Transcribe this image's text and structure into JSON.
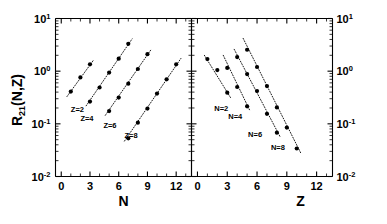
{
  "figure": {
    "background_color": "#ffffff",
    "marker_color": "#000000",
    "line_color": "#000000"
  },
  "chart_data": {
    "type": "scatter",
    "title": "",
    "scale": "semilog-y",
    "grid": false,
    "legend_position": "inline-annotations",
    "ylabel": "R21(N,Z)",
    "ylabel_base": "R",
    "ylabel_subscript": "21",
    "ylabel_tail": "(N,Z)",
    "ylim": [
      0.01,
      10
    ],
    "ytick_values": [
      0.01,
      0.1,
      1,
      10
    ],
    "ytick_labels": [
      "10-2",
      "10-1",
      "100",
      "101"
    ],
    "ytick_mantissa": "10",
    "ytick_exponents": [
      "-2",
      "-1",
      "0",
      "1"
    ],
    "panels": [
      {
        "name": "left-panel",
        "xlabel": "N",
        "xlim": [
          -0.6,
          13.6
        ],
        "xtick_values": [
          0,
          3,
          6,
          9,
          12
        ],
        "xtick_labels": [
          "0",
          "3",
          "6",
          "9",
          "12"
        ],
        "series": [
          {
            "name": "Z=2",
            "label": "Z=2",
            "label_x": 1.0,
            "label_y": 0.17,
            "x": [
              1,
              2,
              3
            ],
            "y": [
              0.41,
              0.76,
              1.35
            ],
            "fit": {
              "x0": 0.6,
              "y0": 0.33,
              "x1": 3.4,
              "y1": 1.65
            }
          },
          {
            "name": "Z=4",
            "label": "Z=4",
            "label_x": 2.0,
            "label_y": 0.115,
            "x": [
              3,
              4,
              5,
              6,
              7
            ],
            "y": [
              0.265,
              0.49,
              0.94,
              1.73,
              3.3
            ],
            "fit": {
              "x0": 2.6,
              "y0": 0.22,
              "x1": 7.4,
              "y1": 4.1
            }
          },
          {
            "name": "Z=6",
            "label": "Z=6",
            "label_x": 4.4,
            "label_y": 0.082,
            "x": [
              5,
              6,
              7,
              8,
              9
            ],
            "y": [
              0.175,
              0.315,
              0.58,
              1.1,
              2.1
            ],
            "fit": {
              "x0": 4.6,
              "y0": 0.145,
              "x1": 9.4,
              "y1": 2.6
            }
          },
          {
            "name": "Z=8",
            "label": "Z=8",
            "label_x": 6.6,
            "label_y": 0.055,
            "x": [
              8,
              9,
              10,
              11,
              12
            ],
            "y": [
              0.105,
              0.195,
              0.375,
              0.7,
              1.35
            ],
            "fit": {
              "x0": 6.6,
              "y0": 0.047,
              "x1": 12.5,
              "y1": 1.75
            }
          }
        ],
        "extra_points": [
          {
            "x": 7,
            "y": 0.053
          }
        ]
      },
      {
        "name": "right-panel",
        "xlabel": "Z",
        "xlim": [
          -0.6,
          13.6
        ],
        "xtick_values": [
          0,
          3,
          6,
          9,
          12
        ],
        "xtick_labels": [
          "0",
          "3",
          "6",
          "9",
          "12"
        ],
        "series": [
          {
            "name": "N=2",
            "label": "N=2",
            "label_x": 1.7,
            "label_y": 0.175,
            "x": [
              1,
              2,
              3
            ],
            "y": [
              1.7,
              1.05,
              0.39
            ],
            "fit": {
              "x0": 0.7,
              "y0": 2.0,
              "x1": 3.4,
              "y1": 0.3
            }
          },
          {
            "name": "N=4",
            "label": "N=4",
            "label_x": 3.1,
            "label_y": 0.125,
            "x": [
              3,
              4,
              5
            ],
            "y": [
              1.15,
              0.5,
              0.215
            ],
            "fit": {
              "x0": 2.6,
              "y0": 2.0,
              "x1": 5.3,
              "y1": 0.175
            }
          },
          {
            "name": "N=6",
            "label": "N=6",
            "label_x": 5.1,
            "label_y": 0.057,
            "x": [
              4,
              5,
              6,
              7,
              8
            ],
            "y": [
              1.85,
              0.88,
              0.42,
              0.155,
              0.068
            ],
            "fit": {
              "x0": 3.7,
              "y0": 2.6,
              "x1": 8.3,
              "y1": 0.058
            }
          },
          {
            "name": "N=8",
            "label": "N=8",
            "label_x": 7.4,
            "label_y": 0.032,
            "x": [
              5,
              6,
              7,
              8,
              9,
              10
            ],
            "y": [
              2.55,
              1.2,
              0.52,
              0.205,
              0.085,
              0.034
            ],
            "fit": {
              "x0": 4.6,
              "y0": 4.2,
              "x1": 10.4,
              "y1": 0.028
            }
          }
        ],
        "extra_points": []
      }
    ]
  }
}
